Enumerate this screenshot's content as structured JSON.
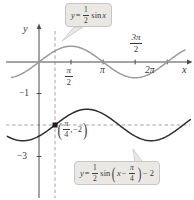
{
  "figure": {
    "y_axis_label": "y",
    "x_axis_label": "x",
    "x_tick_labels": {
      "half_pi": {
        "num": "π",
        "den": "2"
      },
      "pi": "π",
      "three_half_pi": {
        "num": "3π",
        "den": "2"
      },
      "two_pi": "2π"
    },
    "y_tick_labels": {
      "minus1": "−1",
      "minus3": "−3"
    },
    "point_label": {
      "open": "(",
      "num": "π",
      "den": "4",
      "comma": ",",
      "value": "−2",
      "close": ")"
    },
    "formula_top": {
      "lhs": "y",
      "equals": "=",
      "num": "1",
      "den": "2",
      "fn": "sin",
      "arg": "x"
    },
    "formula_bottom": {
      "lhs": "y",
      "equals": "=",
      "num": "1",
      "den": "2",
      "fn": "sin",
      "open": "(",
      "arg": "x",
      "minus": "−",
      "pnum": "π",
      "pden": "4",
      "close": ")",
      "tail": "− 2"
    }
  },
  "chart_data": {
    "type": "line",
    "title": "",
    "xlabel": "x",
    "ylabel": "y",
    "xlim": [
      -1.6,
      7.5
    ],
    "ylim": [
      -3.7,
      1.3
    ],
    "grid": false,
    "legend": "callout-boxes",
    "x_tick_values": [
      1.5708,
      3.14159,
      4.71239,
      6.28319
    ],
    "x_tick_display": [
      "π/2",
      "π",
      "3π/2",
      "2π"
    ],
    "y_tick_values": [
      -1,
      -3
    ],
    "y_tick_display": [
      "−1",
      "−3"
    ],
    "series": [
      {
        "name": "y = (1/2) sin x",
        "amplitude": 0.5,
        "phase_shift": 0,
        "vertical_shift": 0,
        "x_range": [
          -1.35,
          7.15
        ],
        "color": "#9b9b9b"
      },
      {
        "name": "y = (1/2) sin(x − π/4) − 2",
        "amplitude": 0.5,
        "phase_shift": 0.7853981634,
        "vertical_shift": -2,
        "x_range": [
          -1.55,
          7.42
        ],
        "color": "#2e2e2e"
      }
    ],
    "marked_point": {
      "x": 0.7853981634,
      "y": -2,
      "label": "(π/4, −2)",
      "color": "#1c1c1c"
    },
    "guides": {
      "vertical_x": 0.7853981634,
      "horizontal_y": -2,
      "style": "dashed",
      "color": "#999999"
    },
    "axis_color": "#4a4a4a"
  }
}
